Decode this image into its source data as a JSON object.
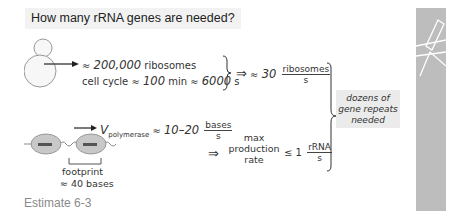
{
  "title": "How many rRNA genes are needed?",
  "top_row": {
    "ribosomes": "≈ 200,000 ribosomes",
    "ribosomes_num": "200,000",
    "ribosomes_unit": "ribosomes",
    "cell_cycle_label": "cell cycle",
    "cell_cycle_min": "100",
    "cell_cycle_min_unit": "min",
    "cell_cycle_s": "6000",
    "cell_cycle_s_unit": "s",
    "approx": "≈",
    "implies": "⇒",
    "rate_value": "30",
    "rate_numerator": "ribosomes",
    "rate_denominator": "s"
  },
  "bottom_row": {
    "v_symbol": "V",
    "v_subscript": "polymerase",
    "v_range": "10–20",
    "v_numerator": "bases",
    "v_denominator": "s",
    "implies": "⇒",
    "max_label_1": "max",
    "max_label_2": "production",
    "max_label_3": "rate",
    "leq": "≤",
    "max_value": "1",
    "max_numerator": "rRNA",
    "max_denominator": "s",
    "footprint_label": "footprint",
    "footprint_value": "≈ 40 bases"
  },
  "result": {
    "line1": "dozens of",
    "line2": "gene repeats",
    "line3": "needed"
  },
  "caption": "Estimate 6-3",
  "icons": {
    "cell": "yeast-cell-icon",
    "polymerase": "polymerase-on-dna-icon",
    "side": "pencil-icon"
  },
  "colors": {
    "title_bg": "#f2f2f2",
    "result_bg": "#ebebeb",
    "side_strip": "#bdbdbd",
    "caption": "#8a8a8a",
    "polymerase_fill": "#c8c8c8"
  }
}
